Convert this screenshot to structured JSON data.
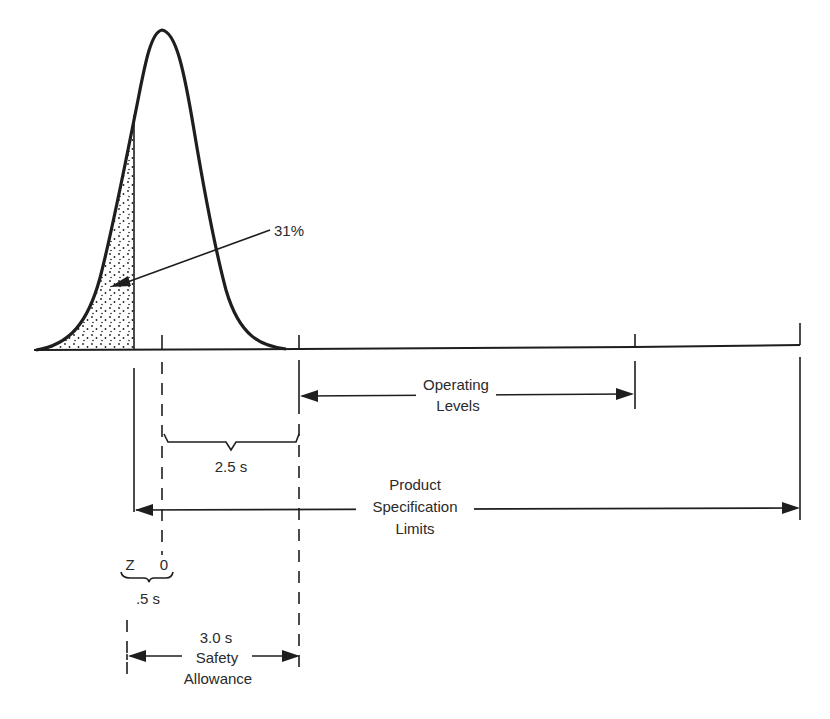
{
  "diagram": {
    "type": "normal-distribution-specification-diagram",
    "colors": {
      "ink": "#1e1e1e",
      "text": "#2a2a2a",
      "background": "#ffffff"
    },
    "curve": {
      "description": "Normal distribution curve with shaded left tail",
      "shaded_area_label": "31%"
    },
    "labels": {
      "percent": "31%",
      "operating_line1": "Operating",
      "operating_line2": "Levels",
      "brace_2_5": "2.5 s",
      "product_line1": "Product",
      "product_line2": "Specification",
      "product_line3": "Limits",
      "z": "Z",
      "zero": "0",
      "brace_0_5": ".5 s",
      "safety_value": "3.0 s",
      "safety_line1": "Safety",
      "safety_line2": "Allowance"
    }
  }
}
